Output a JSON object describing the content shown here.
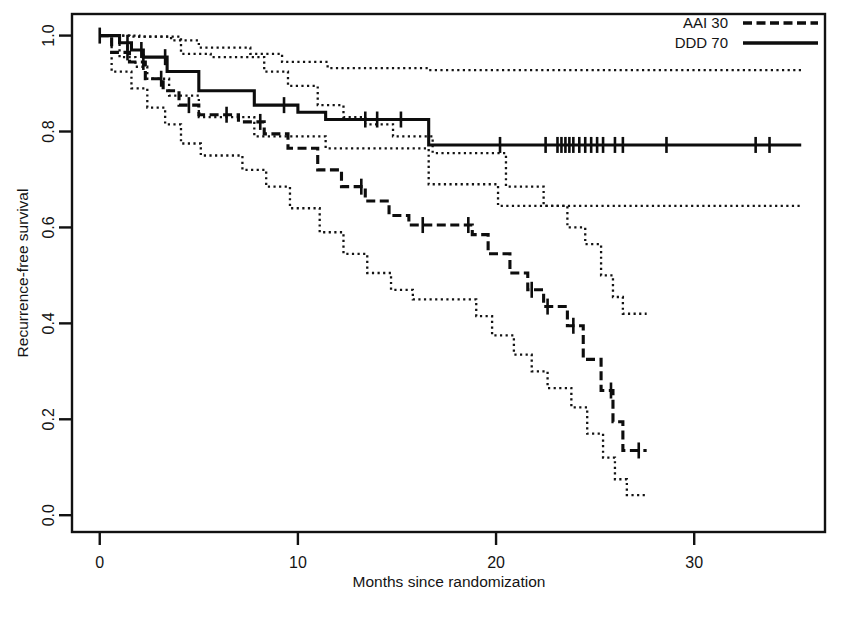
{
  "figure": {
    "title": "",
    "caption_partial": ""
  },
  "axes": {
    "x_label": "Months since randomization",
    "y_label": "Recurrence-free survival",
    "x_ticks": [
      0,
      10,
      20,
      30
    ],
    "y_ticks": [
      "0.0",
      "0.2",
      "0.4",
      "0.6",
      "0.8",
      "1.0"
    ],
    "x_tick_labels": [
      "0",
      "10",
      "20",
      "30"
    ],
    "x_range": [
      -1.4,
      36.6
    ],
    "y_range": [
      -0.035,
      1.045
    ]
  },
  "legend": {
    "position": "top-right",
    "entries": [
      {
        "label": "AAI 30",
        "style": "dashed"
      },
      {
        "label": "DDD 70",
        "style": "solid"
      }
    ]
  },
  "colors": {
    "ink": "#0d0d0d",
    "frame": "#111111",
    "background": "#ffffff"
  },
  "chart_data": {
    "type": "line",
    "subtype": "kaplan-meier-survival",
    "title": "",
    "xlabel": "Months since randomization",
    "ylabel": "Recurrence-free survival",
    "xlim": [
      -1.4,
      36.6
    ],
    "ylim": [
      -0.035,
      1.045
    ],
    "grid": false,
    "legend_position": "top-right",
    "series": [
      {
        "name": "DDD 70",
        "style": "solid",
        "step": "hv",
        "points": [
          [
            0.0,
            1.0
          ],
          [
            1.0,
            1.0
          ],
          [
            1.0,
            0.985
          ],
          [
            1.6,
            0.985
          ],
          [
            1.6,
            0.97
          ],
          [
            2.2,
            0.97
          ],
          [
            2.2,
            0.955
          ],
          [
            3.4,
            0.955
          ],
          [
            3.4,
            0.925
          ],
          [
            5.0,
            0.925
          ],
          [
            5.0,
            0.885
          ],
          [
            7.8,
            0.885
          ],
          [
            7.8,
            0.855
          ],
          [
            10.0,
            0.855
          ],
          [
            10.0,
            0.84
          ],
          [
            11.4,
            0.84
          ],
          [
            11.4,
            0.825
          ],
          [
            16.6,
            0.825
          ],
          [
            16.6,
            0.772
          ],
          [
            35.4,
            0.772
          ]
        ],
        "censor_times": [
          0.0,
          1.4,
          2.1,
          3.3,
          9.3,
          13.4,
          14.0,
          15.2,
          20.2,
          22.5,
          23.1,
          23.3,
          23.5,
          23.7,
          23.9,
          24.2,
          24.5,
          24.8,
          25.1,
          25.4,
          26.0,
          26.4,
          28.6,
          33.1,
          33.8
        ],
        "confidence_band_upper": [
          [
            0.0,
            1.0
          ],
          [
            2.0,
            1.0
          ],
          [
            2.0,
            0.998
          ],
          [
            3.6,
            0.998
          ],
          [
            3.6,
            0.99
          ],
          [
            5.0,
            0.99
          ],
          [
            5.0,
            0.975
          ],
          [
            7.6,
            0.975
          ],
          [
            7.6,
            0.962
          ],
          [
            9.2,
            0.962
          ],
          [
            9.2,
            0.945
          ],
          [
            11.5,
            0.945
          ],
          [
            11.5,
            0.932
          ],
          [
            16.6,
            0.932
          ],
          [
            16.6,
            0.928
          ],
          [
            35.4,
            0.928
          ]
        ],
        "confidence_band_lower": [
          [
            0.0,
            1.0
          ],
          [
            1.0,
            1.0
          ],
          [
            1.0,
            0.955
          ],
          [
            1.8,
            0.955
          ],
          [
            1.8,
            0.935
          ],
          [
            2.4,
            0.935
          ],
          [
            2.4,
            0.91
          ],
          [
            3.5,
            0.91
          ],
          [
            3.5,
            0.875
          ],
          [
            5.0,
            0.875
          ],
          [
            5.0,
            0.83
          ],
          [
            7.8,
            0.83
          ],
          [
            7.8,
            0.79
          ],
          [
            11.4,
            0.79
          ],
          [
            11.4,
            0.765
          ],
          [
            16.6,
            0.765
          ],
          [
            16.6,
            0.69
          ],
          [
            20.1,
            0.69
          ],
          [
            20.1,
            0.645
          ],
          [
            35.4,
            0.645
          ]
        ]
      },
      {
        "name": "AAI 30",
        "style": "dashed",
        "step": "hv",
        "points": [
          [
            0.0,
            1.0
          ],
          [
            0.6,
            1.0
          ],
          [
            0.6,
            0.965
          ],
          [
            1.5,
            0.965
          ],
          [
            1.5,
            0.945
          ],
          [
            2.3,
            0.945
          ],
          [
            2.3,
            0.91
          ],
          [
            3.2,
            0.91
          ],
          [
            3.2,
            0.885
          ],
          [
            4.0,
            0.885
          ],
          [
            4.0,
            0.855
          ],
          [
            5.0,
            0.855
          ],
          [
            5.0,
            0.835
          ],
          [
            7.0,
            0.835
          ],
          [
            7.0,
            0.82
          ],
          [
            8.3,
            0.82
          ],
          [
            8.3,
            0.795
          ],
          [
            9.5,
            0.795
          ],
          [
            9.5,
            0.765
          ],
          [
            11.0,
            0.765
          ],
          [
            11.0,
            0.72
          ],
          [
            12.2,
            0.72
          ],
          [
            12.2,
            0.685
          ],
          [
            13.4,
            0.685
          ],
          [
            13.4,
            0.655
          ],
          [
            14.6,
            0.655
          ],
          [
            14.6,
            0.625
          ],
          [
            15.6,
            0.625
          ],
          [
            15.6,
            0.605
          ],
          [
            18.8,
            0.605
          ],
          [
            18.8,
            0.585
          ],
          [
            19.6,
            0.585
          ],
          [
            19.6,
            0.545
          ],
          [
            20.7,
            0.545
          ],
          [
            20.7,
            0.505
          ],
          [
            21.6,
            0.505
          ],
          [
            21.6,
            0.47
          ],
          [
            22.4,
            0.47
          ],
          [
            22.4,
            0.435
          ],
          [
            23.6,
            0.435
          ],
          [
            23.6,
            0.395
          ],
          [
            24.4,
            0.395
          ],
          [
            24.4,
            0.325
          ],
          [
            25.3,
            0.325
          ],
          [
            25.3,
            0.26
          ],
          [
            25.9,
            0.26
          ],
          [
            25.9,
            0.195
          ],
          [
            26.4,
            0.195
          ],
          [
            26.4,
            0.135
          ],
          [
            27.6,
            0.135
          ]
        ],
        "censor_times": [
          1.4,
          2.2,
          3.1,
          4.5,
          6.4,
          8.1,
          13.2,
          16.3,
          18.6,
          21.8,
          22.6,
          23.9,
          25.8,
          27.2
        ],
        "confidence_band_upper": [
          [
            0.0,
            1.0
          ],
          [
            1.5,
            1.0
          ],
          [
            1.5,
            0.998
          ],
          [
            4.1,
            0.998
          ],
          [
            4.1,
            0.962
          ],
          [
            5.6,
            0.962
          ],
          [
            5.6,
            0.955
          ],
          [
            8.3,
            0.955
          ],
          [
            8.3,
            0.925
          ],
          [
            9.5,
            0.925
          ],
          [
            9.5,
            0.895
          ],
          [
            11.0,
            0.895
          ],
          [
            11.0,
            0.855
          ],
          [
            12.3,
            0.855
          ],
          [
            12.3,
            0.83
          ],
          [
            13.4,
            0.83
          ],
          [
            13.4,
            0.815
          ],
          [
            14.8,
            0.815
          ],
          [
            14.8,
            0.79
          ],
          [
            16.8,
            0.79
          ],
          [
            16.8,
            0.755
          ],
          [
            20.5,
            0.755
          ],
          [
            20.5,
            0.685
          ],
          [
            22.4,
            0.685
          ],
          [
            22.4,
            0.645
          ],
          [
            23.6,
            0.645
          ],
          [
            23.6,
            0.6
          ],
          [
            24.5,
            0.6
          ],
          [
            24.5,
            0.565
          ],
          [
            25.3,
            0.565
          ],
          [
            25.3,
            0.5
          ],
          [
            25.9,
            0.5
          ],
          [
            25.9,
            0.455
          ],
          [
            26.4,
            0.455
          ],
          [
            26.4,
            0.42
          ],
          [
            27.6,
            0.42
          ]
        ],
        "confidence_band_lower": [
          [
            0.0,
            1.0
          ],
          [
            0.6,
            1.0
          ],
          [
            0.6,
            0.925
          ],
          [
            1.6,
            0.925
          ],
          [
            1.6,
            0.89
          ],
          [
            2.4,
            0.89
          ],
          [
            2.4,
            0.85
          ],
          [
            3.3,
            0.85
          ],
          [
            3.3,
            0.815
          ],
          [
            4.1,
            0.815
          ],
          [
            4.1,
            0.775
          ],
          [
            5.1,
            0.775
          ],
          [
            5.1,
            0.75
          ],
          [
            7.2,
            0.75
          ],
          [
            7.2,
            0.72
          ],
          [
            8.4,
            0.72
          ],
          [
            8.4,
            0.685
          ],
          [
            9.6,
            0.685
          ],
          [
            9.6,
            0.64
          ],
          [
            11.1,
            0.64
          ],
          [
            11.1,
            0.59
          ],
          [
            12.3,
            0.59
          ],
          [
            12.3,
            0.545
          ],
          [
            13.5,
            0.545
          ],
          [
            13.5,
            0.505
          ],
          [
            14.7,
            0.505
          ],
          [
            14.7,
            0.47
          ],
          [
            15.8,
            0.47
          ],
          [
            15.8,
            0.45
          ],
          [
            19.0,
            0.45
          ],
          [
            19.0,
            0.415
          ],
          [
            19.8,
            0.415
          ],
          [
            19.8,
            0.375
          ],
          [
            20.9,
            0.375
          ],
          [
            20.9,
            0.335
          ],
          [
            21.8,
            0.335
          ],
          [
            21.8,
            0.3
          ],
          [
            22.6,
            0.3
          ],
          [
            22.6,
            0.265
          ],
          [
            23.8,
            0.265
          ],
          [
            23.8,
            0.225
          ],
          [
            24.6,
            0.225
          ],
          [
            24.6,
            0.17
          ],
          [
            25.4,
            0.17
          ],
          [
            25.4,
            0.12
          ],
          [
            26.0,
            0.12
          ],
          [
            26.0,
            0.075
          ],
          [
            26.6,
            0.075
          ],
          [
            26.6,
            0.042
          ],
          [
            27.6,
            0.042
          ]
        ]
      }
    ]
  }
}
